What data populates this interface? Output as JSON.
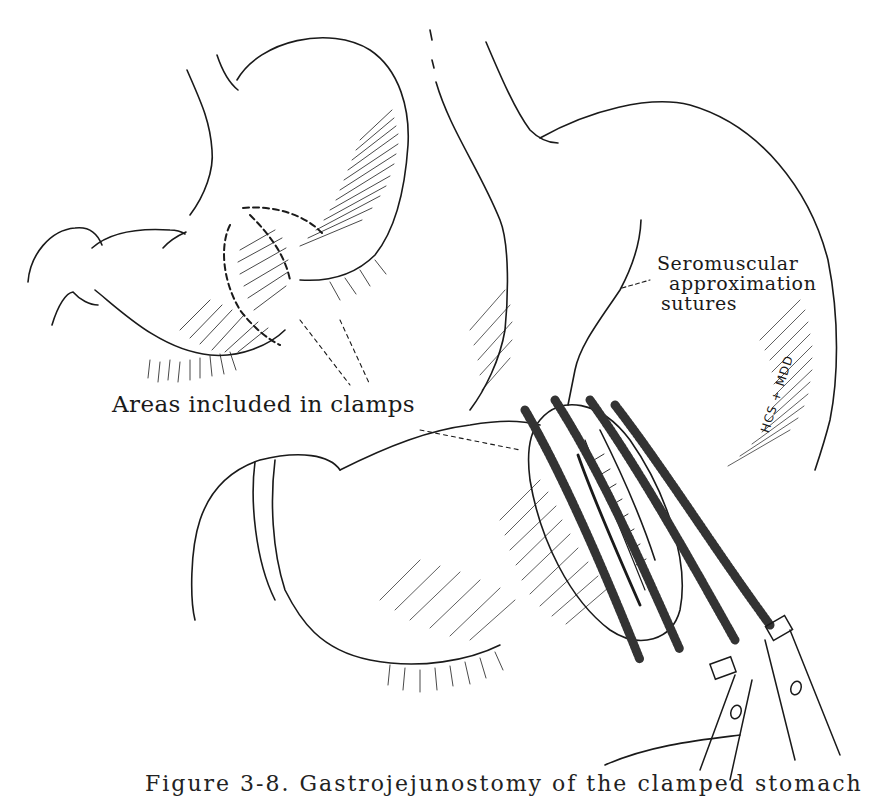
{
  "figure": {
    "type": "medical line illustration",
    "labels": {
      "clamps": "Areas included in clamps",
      "sutures_line1": "Seromuscular",
      "sutures_line2": "approximation",
      "sutures_line3": "sutures"
    },
    "signature": "HCS + MDD",
    "caption": "Figure 3-8. Gastrojejunostomy of the clamped stomach",
    "caption_truncated": true,
    "colors": {
      "ink": "#1a1a1a",
      "background": "#ffffff"
    }
  }
}
